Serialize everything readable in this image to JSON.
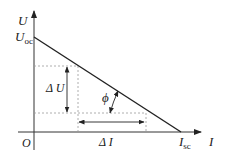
{
  "diagram": {
    "axes": {
      "y_label": "U",
      "x_label": "I",
      "origin_label": "O"
    },
    "points": {
      "y_intercept_label": "U",
      "y_intercept_sub": "oc",
      "x_intercept_label": "I",
      "x_intercept_sub": "sc"
    },
    "annotations": {
      "delta_u": "Δ U",
      "delta_i": "Δ I",
      "angle": "ϕ"
    },
    "colors": {
      "line": "#222222",
      "dashed": "#9a9a9a",
      "background": "#ffffff"
    }
  }
}
